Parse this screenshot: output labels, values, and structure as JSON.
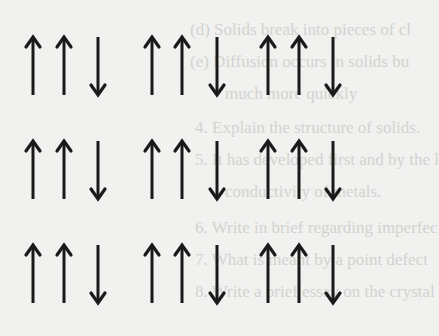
{
  "diagram": {
    "rows": [
      [
        "up",
        "up",
        "down",
        "up",
        "up",
        "down",
        "up",
        "up",
        "down"
      ],
      [
        "up",
        "up",
        "down",
        "up",
        "up",
        "down",
        "up",
        "up",
        "down"
      ],
      [
        "up",
        "up",
        "down",
        "up",
        "up",
        "down",
        "up",
        "up",
        "down"
      ]
    ],
    "arrow_color": "#1a1a1a"
  },
  "bleed_through_text": [
    "(d) Solids break into pieces of cl",
    "(e) Diffusion occurs in solids bu",
    "much more quickly",
    "4.  Explain the structure of solids.",
    "5.  It has developed first and by the l",
    "conductivity of metals.",
    "6.  Write in brief regarding imperfec",
    "7.  What is meant by a point defect",
    "8.  Write a brief essay on the crystal"
  ]
}
